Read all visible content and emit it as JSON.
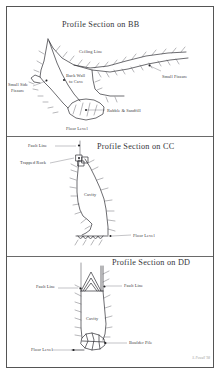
{
  "document": {
    "kind": "cave-survey-profile-sections",
    "signature": "S. Powell '98"
  },
  "sections": [
    {
      "id": "BB",
      "title": "Profile Section on BB",
      "labels": {
        "ceiling_line": "Ceiling Line",
        "small_fissure": "Small Fissure",
        "back_wall_line1": "Back Wall",
        "back_wall_line2": "to Cave",
        "small_side_fissure_line1": "Small Side",
        "small_side_fissure_line2": "Fissure",
        "rubble_sandfill": "Rubble & Sandfill",
        "floor_level": "Floor Level"
      }
    },
    {
      "id": "CC",
      "title": "Profile Section on CC",
      "labels": {
        "fault_line": "Fault Line",
        "trapped_rock": "Trapped Rock",
        "cavity": "Cavity",
        "floor_level": "Floor Level"
      }
    },
    {
      "id": "DD",
      "title": "Profile Section on DD",
      "labels": {
        "fault_line_left": "Fault Line",
        "fault_line_right": "Fault Line",
        "cavity": "Cavity",
        "boulder_pile": "Boulder Pile",
        "floor_level": "Floor Level"
      }
    }
  ],
  "colors": {
    "ink": "#2e2e33",
    "paper": "#ffffff",
    "border": "#555555",
    "label": "#3a3a40"
  }
}
